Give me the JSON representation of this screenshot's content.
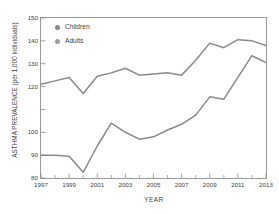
{
  "chart_data": {
    "type": "line",
    "title": "",
    "xlabel": "YEAR",
    "ylabel": "ASTHMA PREVALENCE (per 1,000 individuals)",
    "xlim": [
      1997,
      2013
    ],
    "ylim": [
      80,
      150
    ],
    "grid": false,
    "legend_position": "top-left inside",
    "x_tick_labels": [
      "1997",
      "1999",
      "2001",
      "2003",
      "2005",
      "2007",
      "2009",
      "2011",
      "2013"
    ],
    "x_tick_values": [
      1997,
      1999,
      2001,
      2003,
      2005,
      2007,
      2009,
      2011,
      2013
    ],
    "x_minor_ticks": [
      1998,
      2000,
      2002,
      2004,
      2006,
      2008,
      2010,
      2012
    ],
    "y_tick_labels": [
      "150",
      "140",
      "130",
      "120",
      "110",
      "100",
      "90",
      "80"
    ],
    "y_tick_values": [
      150,
      140,
      130,
      120,
      110,
      100,
      90,
      80
    ],
    "y_tick_110_faint": true,
    "x": [
      1997,
      1998,
      1999,
      2000,
      2001,
      2002,
      2003,
      2004,
      2005,
      2006,
      2007,
      2008,
      2009,
      2010,
      2011,
      2012,
      2013
    ],
    "series": [
      {
        "name": "Children",
        "color": "#8a8a8a",
        "marker": "circle",
        "values": [
          121.0,
          122.5,
          124.0,
          117.0,
          124.5,
          126.0,
          128.0,
          125.0,
          125.5,
          126.0,
          125.0,
          131.5,
          139.0,
          137.0,
          140.5,
          140.0,
          138.0
        ]
      },
      {
        "name": "Adults",
        "color": "#8a8a8a",
        "marker": "circle",
        "values": [
          90.0,
          90.0,
          89.5,
          82.5,
          94.0,
          104.0,
          100.0,
          97.0,
          98.0,
          101.0,
          103.5,
          107.5,
          115.5,
          114.5,
          124.0,
          133.5,
          130.5
        ]
      }
    ],
    "series_tail": {
      "Children": [
        141.5,
        141.5
      ],
      "Adults": [
        129.5,
        128.5
      ]
    }
  },
  "legend": {
    "items": [
      {
        "label": "Children",
        "color": "#8a8a8a"
      },
      {
        "label": "Adults",
        "color": "#9e9e9e"
      }
    ]
  },
  "axes": {
    "x_title": "YEAR",
    "y_title": "ASTHMA PREVALENCE (per 1,000 individuals)",
    "y_ticks": [
      {
        "label": "150",
        "value": 150
      },
      {
        "label": "140",
        "value": 140
      },
      {
        "label": "130",
        "value": 130
      },
      {
        "label": "120",
        "value": 120
      },
      {
        "label": "110",
        "value": 110
      },
      {
        "label": "100",
        "value": 100
      },
      {
        "label": "90",
        "value": 90
      },
      {
        "label": "80",
        "value": 80
      }
    ],
    "x_ticks": [
      {
        "label": "1997",
        "value": 1997
      },
      {
        "label": "1999",
        "value": 1999
      },
      {
        "label": "2001",
        "value": 2001
      },
      {
        "label": "2003",
        "value": 2003
      },
      {
        "label": "2005",
        "value": 2005
      },
      {
        "label": "2007",
        "value": 2007
      },
      {
        "label": "2009",
        "value": 2009
      },
      {
        "label": "2011",
        "value": 2011
      },
      {
        "label": "2013",
        "value": 2013
      }
    ]
  },
  "style": {
    "line_color": "#8a8a8a",
    "frame_color": "#9a9a9a",
    "text_color": "#3f3f3f",
    "background": "#ffffff"
  }
}
